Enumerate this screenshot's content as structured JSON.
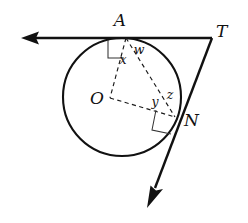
{
  "figure": {
    "background_color": "#ffffff",
    "stroke_color": "#111111",
    "dash_color": "#1a1a1a",
    "width": 248,
    "height": 223
  },
  "points": {
    "A": {
      "label": "A",
      "x": 126,
      "y": 38,
      "label_x": 120,
      "label_y": 26
    },
    "T": {
      "label": "T",
      "x": 212,
      "y": 38,
      "label_x": 216,
      "label_y": 37
    },
    "N": {
      "label": "N",
      "x": 175,
      "y": 117,
      "label_x": 184,
      "label_y": 126
    },
    "O": {
      "label": "O",
      "x": 110,
      "y": 98,
      "label_x": 97,
      "label_y": 104
    }
  },
  "angle_labels": [
    {
      "label": "x",
      "x": 123,
      "y": 64
    },
    {
      "label": "w",
      "x": 139,
      "y": 54
    },
    {
      "label": "y",
      "x": 155,
      "y": 105
    },
    {
      "label": "z",
      "x": 170,
      "y": 99
    }
  ],
  "circle": {
    "center_x": 122,
    "center_y": 97,
    "radius": 59,
    "stroke_width": 2.1
  },
  "tangent_lines": [
    {
      "name": "tangent-at-A",
      "from_x": 212,
      "from_y": 38,
      "to_x": 23,
      "to_y": 38,
      "stroke_width": 2.4,
      "arrow_at": "end"
    },
    {
      "name": "tangent-at-N",
      "from_x": 212,
      "from_y": 38,
      "to_x": 150,
      "to_y": 200,
      "stroke_width": 2.4,
      "arrow_at": "end"
    }
  ],
  "dashed_segments": [
    {
      "name": "radius-OA",
      "x1": 126,
      "y1": 38,
      "x2": 110,
      "y2": 98
    },
    {
      "name": "radius-ON",
      "x1": 110,
      "y1": 98,
      "x2": 175,
      "y2": 117
    },
    {
      "name": "chord-AN",
      "x1": 126,
      "y1": 38,
      "x2": 175,
      "y2": 117
    }
  ],
  "right_angle_markers": [
    {
      "name": "right-angle-at-A",
      "x": 126,
      "y": 38
    },
    {
      "name": "right-angle-at-N",
      "x": 175,
      "y": 117
    }
  ]
}
